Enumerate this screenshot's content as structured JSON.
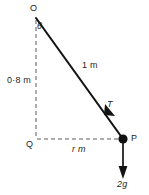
{
  "figure": {
    "labels": {
      "pivot": "O",
      "angle": "θ",
      "vertical_length": "0·8 m",
      "string_length": "1 m",
      "tension": "T",
      "foot": "Q",
      "radius": "r m",
      "particle": "P",
      "weight": "2g"
    },
    "colors": {
      "ink": "#1a1a1a",
      "dashed": "#5a5a5a",
      "background": "#ffffff"
    },
    "geometry": {
      "pivot_point": "O (36, 18)",
      "foot_point": "Q (36, 139)",
      "particle_point": "P (123, 139)",
      "vertical_drop": "0·8 m",
      "string": "1 m",
      "radius": "r m",
      "weight_force": "2g",
      "tension_force": "T"
    }
  }
}
